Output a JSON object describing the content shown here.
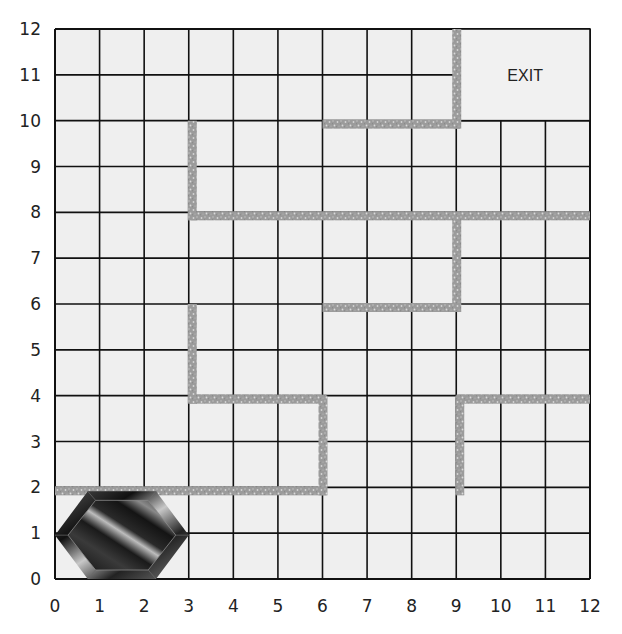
{
  "puzzle": {
    "grid": {
      "cols": 12,
      "rows": 12,
      "x_min": 0,
      "x_max": 12,
      "y_min": 0,
      "y_max": 12
    },
    "x_axis_labels": [
      "0",
      "1",
      "2",
      "3",
      "4",
      "5",
      "6",
      "7",
      "8",
      "9",
      "10",
      "11",
      "12"
    ],
    "y_axis_labels": [
      "0",
      "1",
      "2",
      "3",
      "4",
      "5",
      "6",
      "7",
      "8",
      "9",
      "10",
      "11",
      "12"
    ],
    "exit": {
      "label": "EXIT",
      "x0": 9,
      "x1": 12,
      "y0": 10,
      "y1": 12
    },
    "gem": {
      "name": "hexagonal-gem",
      "x0": 0,
      "x1": 3,
      "y0": 0,
      "y1": 2
    },
    "walls": [
      {
        "orientation": "vertical",
        "x": 3,
        "y0": 8,
        "y1": 10
      },
      {
        "orientation": "horizontal",
        "y": 8,
        "x0": 3,
        "x1": 12
      },
      {
        "orientation": "horizontal",
        "y": 10,
        "x0": 6,
        "x1": 9
      },
      {
        "orientation": "vertical",
        "x": 9,
        "y0": 10,
        "y1": 12
      },
      {
        "orientation": "vertical",
        "x": 9,
        "y0": 6,
        "y1": 8
      },
      {
        "orientation": "horizontal",
        "y": 6,
        "x0": 6,
        "x1": 9
      },
      {
        "orientation": "vertical",
        "x": 3,
        "y0": 4,
        "y1": 6
      },
      {
        "orientation": "horizontal",
        "y": 4,
        "x0": 3,
        "x1": 6
      },
      {
        "orientation": "vertical",
        "x": 6,
        "y0": 2,
        "y1": 4
      },
      {
        "orientation": "horizontal",
        "y": 2,
        "x0": 0,
        "x1": 6
      },
      {
        "orientation": "vertical",
        "x": 9,
        "y0": 2,
        "y1": 4
      },
      {
        "orientation": "horizontal",
        "y": 4,
        "x0": 9,
        "x1": 12
      }
    ],
    "colors": {
      "background": "#ffffff",
      "cell_fill": "#efefef",
      "grid_line": "#111111",
      "wall": "#9b9b9b",
      "wall_speckle": "#d6d6d6",
      "gem_dark": "#1a1a1a",
      "gem_light": "#d0d0d0"
    }
  }
}
